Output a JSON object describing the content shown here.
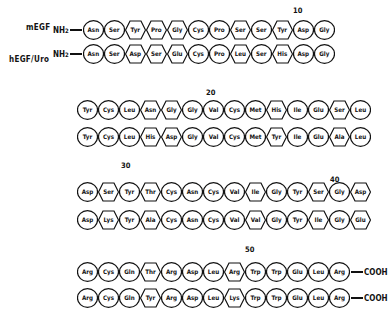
{
  "figure": {
    "labels": {
      "mEGF": "mEGF",
      "hEGF": "hEGF/Uro",
      "n_terminus": "NH",
      "n_sub": "2",
      "c_terminus": "COOH"
    },
    "position_markers": [
      "10",
      "20",
      "30",
      "40",
      "50"
    ],
    "blocks": [
      {
        "mEGF": [
          [
            "Asn",
            "c"
          ],
          [
            "Ser",
            "c"
          ],
          [
            "Tyr",
            "h"
          ],
          [
            "Pro",
            "h"
          ],
          [
            "Gly",
            "h"
          ],
          [
            "Cys",
            "c"
          ],
          [
            "Pro",
            "c"
          ],
          [
            "Ser",
            "h"
          ],
          [
            "Ser",
            "c"
          ],
          [
            "Tyr",
            "h"
          ],
          [
            "Asp",
            "c"
          ],
          [
            "Gly",
            "c"
          ]
        ],
        "hEGF": [
          [
            "Asn",
            "c"
          ],
          [
            "Ser",
            "c"
          ],
          [
            "Asp",
            "h"
          ],
          [
            "Ser",
            "h"
          ],
          [
            "Glu",
            "h"
          ],
          [
            "Cys",
            "c"
          ],
          [
            "Pro",
            "c"
          ],
          [
            "Leu",
            "h"
          ],
          [
            "Ser",
            "c"
          ],
          [
            "His",
            "h"
          ],
          [
            "Asp",
            "c"
          ],
          [
            "Gly",
            "c"
          ]
        ]
      },
      {
        "mEGF": [
          [
            "Tyr",
            "c"
          ],
          [
            "Cys",
            "c"
          ],
          [
            "Leu",
            "c"
          ],
          [
            "Asn",
            "h"
          ],
          [
            "Gly",
            "h"
          ],
          [
            "Gly",
            "c"
          ],
          [
            "Val",
            "c"
          ],
          [
            "Cys",
            "c"
          ],
          [
            "Met",
            "c"
          ],
          [
            "His",
            "h"
          ],
          [
            "Ile",
            "c"
          ],
          [
            "Glu",
            "c"
          ],
          [
            "Ser",
            "h"
          ],
          [
            "Leu",
            "c"
          ]
        ],
        "hEGF": [
          [
            "Tyr",
            "c"
          ],
          [
            "Cys",
            "c"
          ],
          [
            "Leu",
            "c"
          ],
          [
            "His",
            "h"
          ],
          [
            "Asp",
            "h"
          ],
          [
            "Gly",
            "c"
          ],
          [
            "Val",
            "c"
          ],
          [
            "Cys",
            "c"
          ],
          [
            "Met",
            "c"
          ],
          [
            "Tyr",
            "h"
          ],
          [
            "Ile",
            "c"
          ],
          [
            "Glu",
            "c"
          ],
          [
            "Ala",
            "h"
          ],
          [
            "Leu",
            "c"
          ]
        ]
      },
      {
        "mEGF": [
          [
            "Asp",
            "c"
          ],
          [
            "Ser",
            "h"
          ],
          [
            "Tyr",
            "c"
          ],
          [
            "Thr",
            "h"
          ],
          [
            "Cys",
            "c"
          ],
          [
            "Asn",
            "c"
          ],
          [
            "Cys",
            "c"
          ],
          [
            "Val",
            "c"
          ],
          [
            "Ile",
            "h"
          ],
          [
            "Gly",
            "c"
          ],
          [
            "Tyr",
            "c"
          ],
          [
            "Ser",
            "h"
          ],
          [
            "Gly",
            "c"
          ],
          [
            "Asp",
            "h"
          ]
        ],
        "hEGF": [
          [
            "Asp",
            "c"
          ],
          [
            "Lys",
            "h"
          ],
          [
            "Tyr",
            "c"
          ],
          [
            "Ala",
            "h"
          ],
          [
            "Cys",
            "c"
          ],
          [
            "Asn",
            "c"
          ],
          [
            "Cys",
            "c"
          ],
          [
            "Val",
            "c"
          ],
          [
            "Val",
            "h"
          ],
          [
            "Gly",
            "c"
          ],
          [
            "Tyr",
            "c"
          ],
          [
            "Ile",
            "h"
          ],
          [
            "Gly",
            "c"
          ],
          [
            "Glu",
            "h"
          ]
        ]
      },
      {
        "mEGF": [
          [
            "Arg",
            "c"
          ],
          [
            "Cys",
            "c"
          ],
          [
            "Gln",
            "c"
          ],
          [
            "Thr",
            "h"
          ],
          [
            "Arg",
            "c"
          ],
          [
            "Asp",
            "c"
          ],
          [
            "Leu",
            "c"
          ],
          [
            "Arg",
            "h"
          ],
          [
            "Trp",
            "c"
          ],
          [
            "Trp",
            "c"
          ],
          [
            "Glu",
            "c"
          ],
          [
            "Leu",
            "c"
          ],
          [
            "Arg",
            "c"
          ]
        ],
        "hEGF": [
          [
            "Arg",
            "c"
          ],
          [
            "Cys",
            "c"
          ],
          [
            "Gln",
            "c"
          ],
          [
            "Tyr",
            "h"
          ],
          [
            "Arg",
            "c"
          ],
          [
            "Asp",
            "c"
          ],
          [
            "Leu",
            "c"
          ],
          [
            "Lys",
            "h"
          ],
          [
            "Trp",
            "c"
          ],
          [
            "Trp",
            "c"
          ],
          [
            "Glu",
            "c"
          ],
          [
            "Leu",
            "c"
          ],
          [
            "Arg",
            "c"
          ]
        ]
      }
    ]
  }
}
